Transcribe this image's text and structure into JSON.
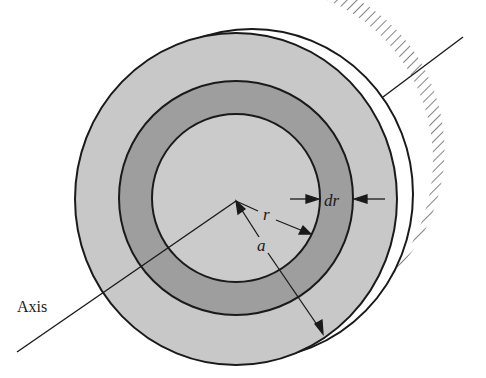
{
  "figure": {
    "type": "disk with annular ring element",
    "labels": {
      "axis": "Axis",
      "radius_r": "r",
      "radius_a": "a",
      "ring_width": "dr"
    }
  },
  "colors": {
    "disk_fill": "#c8c8c8",
    "ring_fill": "#9e9e9e",
    "inner_fill": "#cbcbcb",
    "stroke": "#1a1a1a",
    "rim_fill": "#ffffff"
  }
}
